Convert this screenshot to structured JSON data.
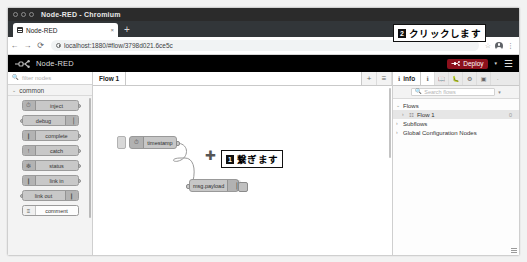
{
  "window": {
    "title": "Node-RED - Chromium",
    "controls": [
      "minimize",
      "maximize",
      "close"
    ]
  },
  "browser": {
    "tab": {
      "title": "Node-RED",
      "close_label": "×",
      "favicon": "node-red-favicon"
    },
    "new_tab_label": "+",
    "nav": {
      "back": "←",
      "forward": "→",
      "reload": "⟳"
    },
    "omnibox": {
      "host": "localhost:1880",
      "path": "/#flow/3798d021.6ce5c",
      "full_url": "localhost:1880/#flow/3798d021.6ce5c",
      "lock_icon": "info-circle-icon"
    },
    "actions": {
      "bookmark": "☆",
      "profile": "account-avatar",
      "menu": "⋮"
    }
  },
  "nodered": {
    "brand": "Node-RED",
    "deploy": {
      "label": "Deploy",
      "caret": "▾",
      "color": "#8c101c"
    },
    "menu_label": "☰"
  },
  "palette": {
    "search_placeholder": "filter nodes",
    "category": {
      "label": "common",
      "caret": "⌄"
    },
    "nodes": [
      {
        "label": "inject",
        "icon": "⏱",
        "reversed": false,
        "has_input": false,
        "has_output": true
      },
      {
        "label": "debug",
        "icon": "▕",
        "reversed": true,
        "has_input": true,
        "has_output": false
      },
      {
        "label": "complete",
        "icon": "❙",
        "reversed": false,
        "has_input": false,
        "has_output": true
      },
      {
        "label": "catch",
        "icon": "!",
        "reversed": false,
        "has_input": false,
        "has_output": true
      },
      {
        "label": "status",
        "icon": "❇",
        "reversed": false,
        "has_input": false,
        "has_output": true
      },
      {
        "label": "link in",
        "icon": "❙",
        "reversed": false,
        "has_input": false,
        "has_output": true
      },
      {
        "label": "link out",
        "icon": "❙",
        "reversed": true,
        "has_input": true,
        "has_output": false
      },
      {
        "label": "comment",
        "icon": "≡",
        "reversed": false,
        "has_input": false,
        "has_output": false
      }
    ]
  },
  "flow": {
    "tabs": [
      {
        "label": "Flow 1",
        "active": true
      }
    ],
    "add_tab_label": "+",
    "tab_menu_label": "≡",
    "nodes": [
      {
        "id": "inject-node",
        "label": "timestamp",
        "icon": "⏱",
        "reversed": false,
        "x": 36,
        "y": 50
      },
      {
        "id": "debug-node",
        "label": "msg.payload",
        "icon": "▕",
        "reversed": true,
        "x": 96,
        "y": 93
      }
    ]
  },
  "annotations": [
    {
      "number": "1",
      "text": "繋ぎます"
    },
    {
      "number": "2",
      "text": "クリックします"
    }
  ],
  "sidebar": {
    "active_tab": {
      "label": "info",
      "icon": "ℹ"
    },
    "tab_icons": [
      "info-icon",
      "help-book-icon",
      "debug-bug-icon",
      "settings-gear-icon",
      "dashboard-icon",
      "more-icon"
    ],
    "search_placeholder": "Search flows",
    "search_caret": "▾",
    "tree": [
      {
        "label": "Flows",
        "level": 0,
        "caret": "⌄",
        "icon": "",
        "count": ""
      },
      {
        "label": "Flow 1",
        "level": 1,
        "caret": "›",
        "icon": "☷",
        "count": "0"
      },
      {
        "label": "Subflows",
        "level": 0,
        "caret": "›",
        "icon": "",
        "count": ""
      },
      {
        "label": "Global Configuration Nodes",
        "level": 0,
        "caret": "›",
        "icon": "",
        "count": ""
      }
    ]
  }
}
